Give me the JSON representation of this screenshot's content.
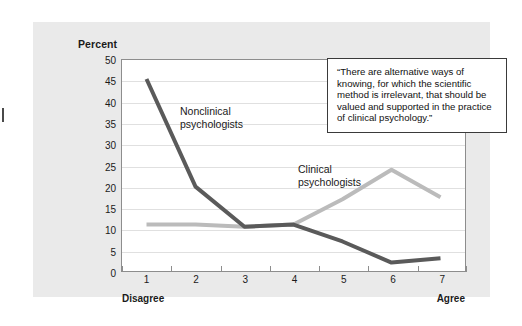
{
  "figure": {
    "y_axis_title": "Percent",
    "x_axis_left_anchor": "Disagree",
    "x_axis_right_anchor": "Agree",
    "quote": "“There are alternative ways of knowing, for which the scientific method is irrelevant, that should be valued and supported in the practice of clinical psychology.”",
    "series_label_dark": "Nonclinical\npsychologists",
    "series_label_light": "Clinical\npsychologists",
    "colors": {
      "panel_background": "#eaeaea",
      "plot_background": "#ffffff",
      "gridline": "#e0e0e0",
      "axis": "#8d8d8d",
      "dark_series": "#5a5a5a",
      "light_series": "#bbbbbb",
      "text": "#1a1a1a",
      "quote_border": "#3a3a3a"
    }
  },
  "chart_data": {
    "type": "line",
    "title": "",
    "xlabel": "",
    "ylabel": "Percent",
    "categories": [
      "1",
      "2",
      "3",
      "4",
      "5",
      "6",
      "7"
    ],
    "x_anchor_low": "Disagree",
    "x_anchor_high": "Agree",
    "ylim": [
      0,
      50
    ],
    "yticks": [
      0,
      5,
      10,
      15,
      20,
      25,
      30,
      35,
      40,
      45,
      50
    ],
    "grid": true,
    "legend": "inline-annotations",
    "annotations": [
      "“There are alternative ways of knowing, for which the scientific method is irrelevant, that should be valued and supported in the practice of clinical psychology.”"
    ],
    "series": [
      {
        "name": "Nonclinical psychologists",
        "color": "#5a5a5a",
        "values": [
          45.5,
          20,
          10.5,
          11,
          7,
          2,
          3
        ]
      },
      {
        "name": "Clinical psychologists",
        "color": "#bbbbbb",
        "values": [
          11,
          11,
          10.5,
          11,
          17,
          24,
          17.5
        ]
      }
    ]
  }
}
